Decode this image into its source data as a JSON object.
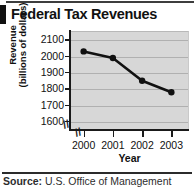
{
  "figure": {
    "title": "Federal Tax Revenues",
    "source_prefix": "Source:",
    "source_text": "U.S. Office of Management"
  },
  "chart_data": {
    "type": "line",
    "title": "Federal Tax Revenues",
    "xlabel": "Year",
    "ylabel_line1": "Revenue",
    "ylabel_line2": "(billions of dollars)",
    "categories": [
      "2000",
      "2001",
      "2002",
      "2003"
    ],
    "values": [
      2025,
      1985,
      1845,
      1775
    ],
    "ytick_labels": [
      "2100",
      "2000",
      "1900",
      "1800",
      "1700",
      "1600"
    ],
    "ytick_values": [
      2100,
      2000,
      1900,
      1800,
      1700,
      1600
    ],
    "ylim": [
      1550,
      2150
    ],
    "grid": true,
    "legend": "none",
    "axis_break": "yes",
    "marker": "filled-circle",
    "line_color": "#111111",
    "plot_background": "#d7d7d7",
    "gridline_color": "#b0b0b0"
  }
}
